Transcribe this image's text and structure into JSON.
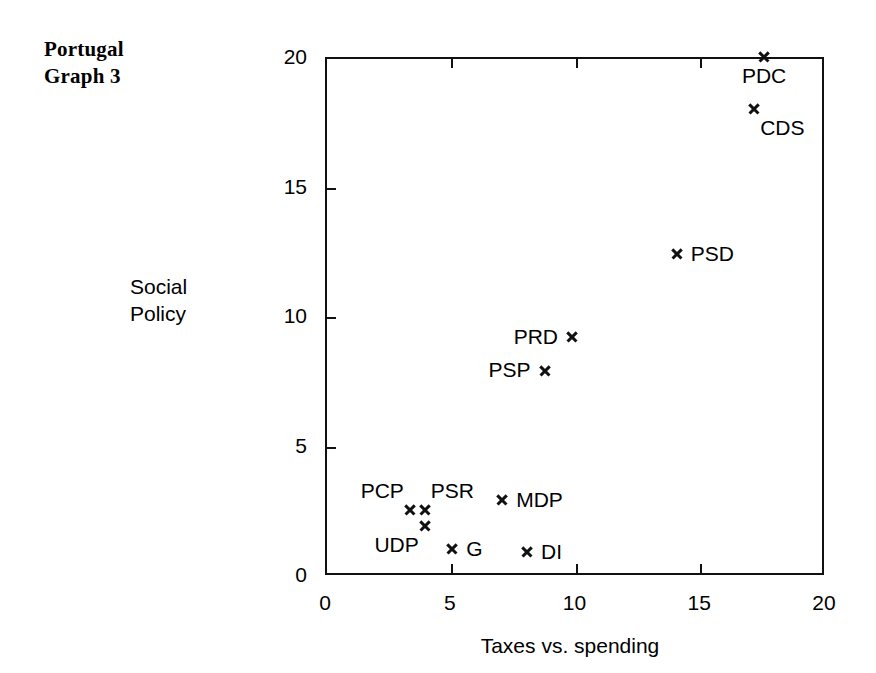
{
  "title": {
    "line1": "Portugal",
    "line2": "Graph 3"
  },
  "axis": {
    "y_label_line1": "Social",
    "y_label_line2": "Policy",
    "x_label": "Taxes vs. spending",
    "x_ticks": [
      "0",
      "5",
      "10",
      "15",
      "20"
    ],
    "y_ticks": [
      "0",
      "5",
      "10",
      "15",
      "20"
    ]
  },
  "chart_data": {
    "type": "scatter",
    "title": "Portugal Graph 3",
    "xlabel": "Taxes vs. spending",
    "ylabel": "Social Policy",
    "xlim": [
      0,
      20
    ],
    "ylim": [
      0,
      20
    ],
    "xticks": [
      0,
      5,
      10,
      15,
      20
    ],
    "yticks": [
      0,
      5,
      10,
      15,
      20
    ],
    "grid": false,
    "legend": "none",
    "marker": "x",
    "points": [
      {
        "label": "PDC",
        "x": 17.6,
        "y": 20.0,
        "label_pos": "below"
      },
      {
        "label": "CDS",
        "x": 17.2,
        "y": 18.0,
        "label_pos": "below-right"
      },
      {
        "label": "PSD",
        "x": 14.1,
        "y": 12.4,
        "label_pos": "right"
      },
      {
        "label": "PRD",
        "x": 9.9,
        "y": 9.2,
        "label_pos": "left"
      },
      {
        "label": "PSP",
        "x": 8.8,
        "y": 7.9,
        "label_pos": "left"
      },
      {
        "label": "MDP",
        "x": 7.1,
        "y": 2.9,
        "label_pos": "right"
      },
      {
        "label": "PSR",
        "x": 4.0,
        "y": 2.5,
        "label_pos": "above-right"
      },
      {
        "label": "PCP",
        "x": 3.4,
        "y": 2.5,
        "label_pos": "above-left"
      },
      {
        "label": "UDP",
        "x": 4.0,
        "y": 1.9,
        "label_pos": "below-left"
      },
      {
        "label": "G",
        "x": 5.1,
        "y": 1.0,
        "label_pos": "right"
      },
      {
        "label": "DI",
        "x": 8.1,
        "y": 0.9,
        "label_pos": "right"
      }
    ]
  },
  "colors": {
    "ink": "#111111",
    "background": "#ffffff"
  }
}
